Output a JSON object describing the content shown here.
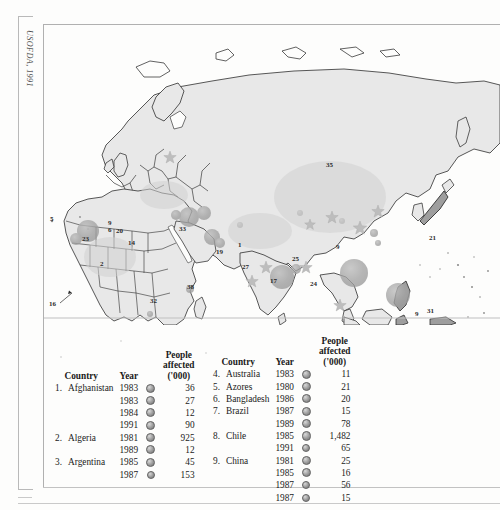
{
  "page": {
    "credit": "USOFDA, 1991",
    "background_color": "#fdfdfc",
    "frame_color": "#b9b9b9"
  },
  "map": {
    "title": "World map of disaster-affected countries (Eastern Hemisphere)",
    "land_fill": "#e8e8e8",
    "land_stroke": "#3a3a3a",
    "marker_fill": "#9e9e9e",
    "star_fill": "#bdbdbd",
    "labels": [
      {
        "id": "5",
        "x": 6,
        "y": 193,
        "boxed": false
      },
      {
        "id": "23",
        "x": 40,
        "y": 213,
        "boxed": false
      },
      {
        "id": "2",
        "x": 58,
        "y": 238,
        "boxed": false
      },
      {
        "id": "16",
        "x": 6,
        "y": 278,
        "boxed": false
      },
      {
        "id": "9",
        "x": 66,
        "y": 197,
        "boxed": false
      },
      {
        "id": "6",
        "x": 66,
        "y": 204,
        "boxed": false
      },
      {
        "id": "20",
        "x": 74,
        "y": 205,
        "boxed": false
      },
      {
        "id": "14",
        "x": 86,
        "y": 217,
        "boxed": false
      },
      {
        "id": "33",
        "x": 137,
        "y": 203,
        "boxed": false
      },
      {
        "id": "19",
        "x": 174,
        "y": 226,
        "boxed": false
      },
      {
        "id": "1",
        "x": 196,
        "y": 219,
        "boxed": false
      },
      {
        "id": "27",
        "x": 200,
        "y": 241,
        "boxed": false
      },
      {
        "id": "17",
        "x": 228,
        "y": 255,
        "boxed": false
      },
      {
        "id": "25",
        "x": 250,
        "y": 233,
        "boxed": false
      },
      {
        "id": "24",
        "x": 268,
        "y": 258,
        "boxed": false
      },
      {
        "id": "9",
        "x": 294,
        "y": 221,
        "boxed": false
      },
      {
        "id": "35",
        "x": 284,
        "y": 139,
        "boxed": false
      },
      {
        "id": "21",
        "x": 387,
        "y": 212,
        "boxed": false
      },
      {
        "id": "32",
        "x": 108,
        "y": 275,
        "boxed": false
      },
      {
        "id": "38",
        "x": 145,
        "y": 261,
        "boxed": false
      },
      {
        "id": "34",
        "x": 108,
        "y": 313,
        "boxed": true
      },
      {
        "id": "9",
        "x": 373,
        "y": 288,
        "boxed": false
      },
      {
        "id": "31",
        "x": 385,
        "y": 285,
        "boxed": false
      },
      {
        "id": "18",
        "x": 345,
        "y": 322,
        "boxed": true
      },
      {
        "id": "18",
        "x": 373,
        "y": 334,
        "boxed": true
      },
      {
        "id": "29",
        "x": 394,
        "y": 331,
        "boxed": true
      },
      {
        "id": "4",
        "x": 394,
        "y": 384,
        "boxed": false
      }
    ]
  },
  "legend": {
    "headers": {
      "country": "Country",
      "year": "Year",
      "affected_line1": "People",
      "affected_line2": "affected",
      "affected_line3": "('000)"
    },
    "left_table": [
      {
        "index": "1.",
        "country": "Afghanistan",
        "year": "1983",
        "value": "36",
        "dot": "md"
      },
      {
        "index": "",
        "country": "",
        "year": "1983",
        "value": "27",
        "dot": "md"
      },
      {
        "index": "",
        "country": "",
        "year": "1984",
        "value": "12",
        "dot": "md"
      },
      {
        "index": "",
        "country": "",
        "year": "1991",
        "value": "90",
        "dot": "md"
      },
      {
        "index": "2.",
        "country": "Algeria",
        "year": "1981",
        "value": "925",
        "dot": "lg"
      },
      {
        "index": "",
        "country": "",
        "year": "1989",
        "value": "12",
        "dot": "md"
      },
      {
        "index": "3.",
        "country": "Argentina",
        "year": "1985",
        "value": "45",
        "dot": "md"
      },
      {
        "index": "",
        "country": "",
        "year": "1987",
        "value": "153",
        "dot": "sm"
      }
    ],
    "right_table": [
      {
        "index": "4.",
        "country": "Australia",
        "year": "1983",
        "value": "11",
        "dot": "md"
      },
      {
        "index": "5.",
        "country": "Azores",
        "year": "1980",
        "value": "21",
        "dot": "md"
      },
      {
        "index": "6.",
        "country": "Bangladesh",
        "year": "1986",
        "value": "20",
        "dot": "md"
      },
      {
        "index": "7.",
        "country": "Brazil",
        "year": "1987",
        "value": "15",
        "dot": "md"
      },
      {
        "index": "",
        "country": "",
        "year": "1989",
        "value": "78",
        "dot": "md"
      },
      {
        "index": "8.",
        "country": "Chile",
        "year": "1985",
        "value": "1,482",
        "dot": "lg"
      },
      {
        "index": "",
        "country": "",
        "year": "1991",
        "value": "65",
        "dot": "sm"
      },
      {
        "index": "9.",
        "country": "China",
        "year": "1981",
        "value": "25",
        "dot": "md"
      },
      {
        "index": "",
        "country": "",
        "year": "1985",
        "value": "16",
        "dot": "md"
      },
      {
        "index": "",
        "country": "",
        "year": "1987",
        "value": "56",
        "dot": "sm"
      },
      {
        "index": "",
        "country": "",
        "year": "1987",
        "value": "15",
        "dot": "sm"
      }
    ]
  }
}
